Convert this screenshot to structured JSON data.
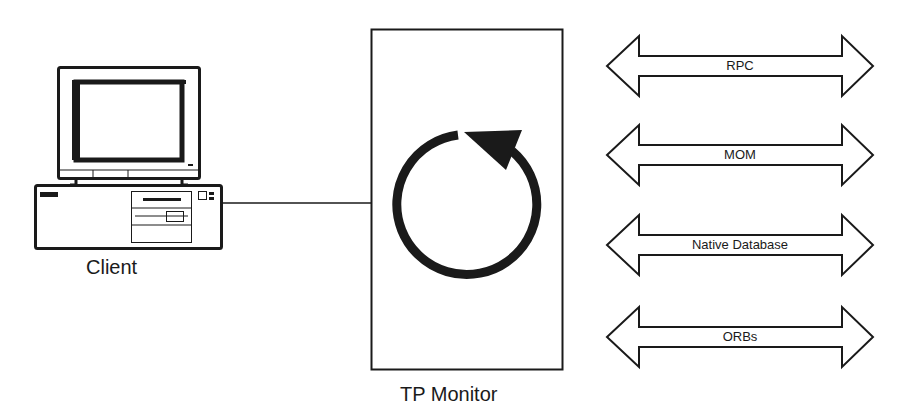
{
  "diagram": {
    "client": {
      "label": "Client",
      "icon": "desktop-computer-icon"
    },
    "tp_monitor": {
      "label": "TP Monitor",
      "icon": "circular-arrow-icon"
    },
    "connections": [
      {
        "label": "RPC"
      },
      {
        "label": "MOM"
      },
      {
        "label": "Native Database"
      },
      {
        "label": "ORBs"
      }
    ],
    "colors": {
      "stroke": "#1a1a1a",
      "background": "#ffffff"
    }
  }
}
